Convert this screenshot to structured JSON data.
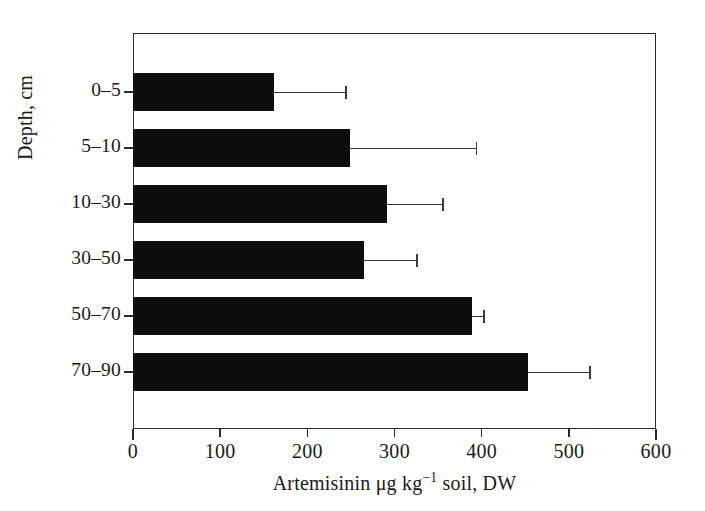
{
  "figure": {
    "background_color": "#ffffff",
    "ink_color": "#0d0d0d",
    "axis_color": "#2b2b2b",
    "error_bar_color": "#3a3a3a"
  },
  "axes": {
    "x": {
      "title_prefix": "Artemisinin μg kg",
      "title_exponent": "−1",
      "title_suffix": " soil, DW",
      "title_full": "Artemisinin μg kg−1 soil, DW",
      "ticks": [
        "0",
        "100",
        "200",
        "300",
        "400",
        "500",
        "600"
      ],
      "min": 0,
      "max": 600
    },
    "y": {
      "title": "Depth, cm",
      "ticks": [
        "0–5",
        "5–10",
        "10–30",
        "30–50",
        "50–70",
        "70–90"
      ]
    }
  },
  "chart_data": {
    "type": "bar",
    "orientation": "horizontal",
    "title": "",
    "subtitle": "",
    "xlabel": "Artemisinin μg kg−1 soil, DW",
    "ylabel": "Depth, cm",
    "categories": [
      "0–5",
      "5–10",
      "10–30",
      "30–50",
      "50–70",
      "70–90"
    ],
    "values": [
      162,
      249,
      291,
      265,
      389,
      453
    ],
    "error_upper": [
      243,
      393,
      355,
      325,
      402,
      523
    ],
    "error_bars": [
      81,
      144,
      64,
      60,
      13,
      70
    ],
    "xlim": [
      0,
      600
    ],
    "xticks": [
      0,
      100,
      200,
      300,
      400,
      500,
      600
    ],
    "grid": false,
    "legend": null,
    "series": [
      {
        "name": "Artemisinin concentration",
        "values": [
          162,
          249,
          291,
          265,
          389,
          453
        ]
      }
    ],
    "annotations": []
  }
}
